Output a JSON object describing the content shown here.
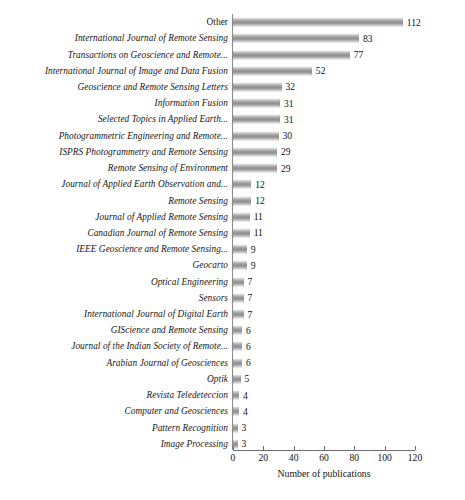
{
  "chart_data": {
    "type": "bar",
    "orientation": "horizontal",
    "title": "",
    "xlabel": "Number of publications",
    "ylabel": "",
    "xlim": [
      0,
      120
    ],
    "xticks": [
      0,
      20,
      40,
      60,
      80,
      100,
      120
    ],
    "grid": false,
    "legend": null,
    "bar_color": "#9a9a9a",
    "categories": [
      "Other",
      "International Journal of Remote Sensing",
      "Transactions on Geoscience and Remote...",
      "International Journal of Image and Data Fusion",
      "Geoscience and Remote Sensing Letters",
      "Information Fusion",
      "Selected Topics in Applied Earth...",
      "Photogrammetric Engineering and Remote...",
      "ISPRS Photogrammetry and Remote Sensing",
      "Remote Sensing of Environment",
      "Journal of Applied Earth Observation and...",
      "Remote Sensing",
      "Journal of Applied Remote Sensing",
      "Canadian Journal of Remote Sensing",
      "IEEE Geoscience and Remote Sensing...",
      "Geocarto",
      "Optical Engineering",
      "Sensors",
      "International Journal of Digital Earth",
      "GIScience and Remote Sensing",
      "Journal of the Indian Society of Remote...",
      "Arabian Journal of Geosciences",
      "Optik",
      "Revista Teledeteccion",
      "Computer and Geosciences",
      "Pattern Recognition",
      "Image Processing"
    ],
    "values": [
      112,
      83,
      77,
      52,
      32,
      31,
      31,
      30,
      29,
      29,
      12,
      12,
      11,
      11,
      9,
      9,
      7,
      7,
      7,
      6,
      6,
      6,
      5,
      4,
      4,
      3,
      3
    ],
    "italic_labels": [
      false,
      true,
      true,
      true,
      true,
      true,
      true,
      true,
      true,
      true,
      true,
      true,
      true,
      true,
      true,
      true,
      true,
      true,
      true,
      true,
      true,
      true,
      true,
      true,
      true,
      true,
      true
    ]
  }
}
